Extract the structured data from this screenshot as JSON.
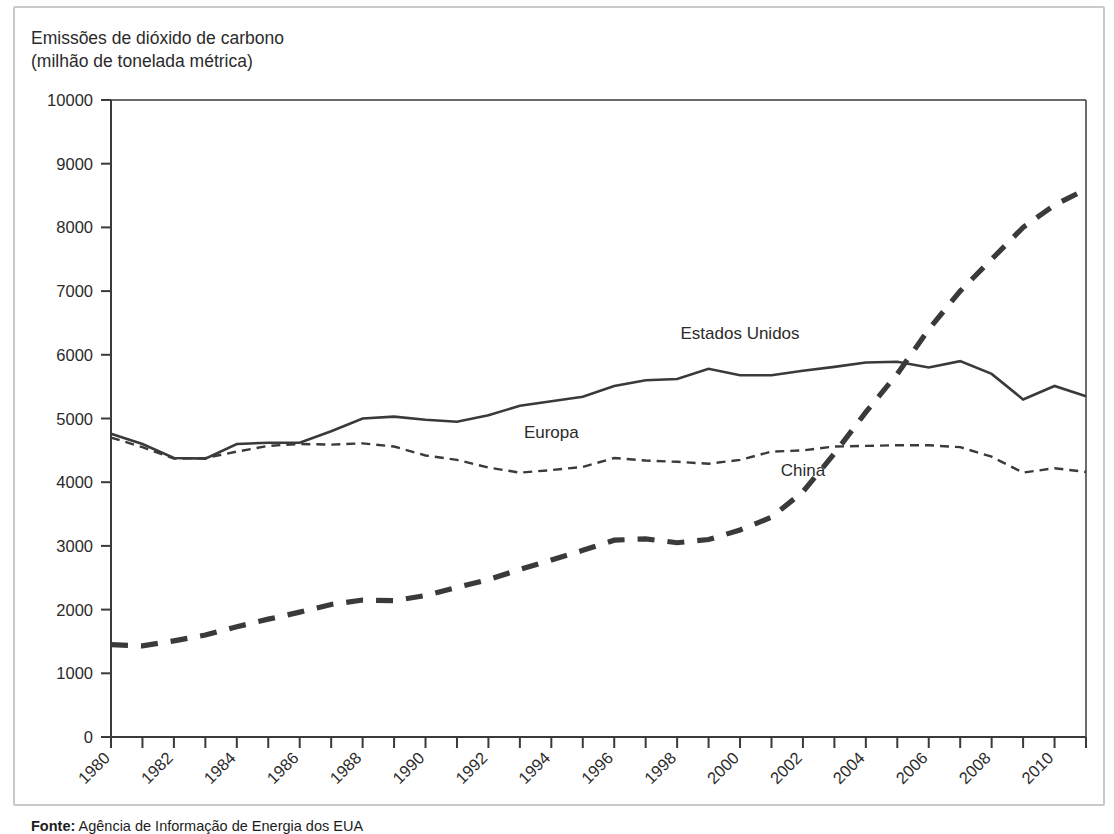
{
  "figure": {
    "axis_title_line1": "Emissões de dióxido de carbono",
    "axis_title_line2": "(milhão de tonelada métrica)",
    "source_label": "Fonte:",
    "source_text": " Agência de Informação de Energia dos EUA",
    "frame_color": "#c9c9c9",
    "line_color": "#3a3a3a",
    "text_color": "#2b2b2b"
  },
  "chart_data": {
    "type": "line",
    "title": "Emissões de dióxido de carbono (milhão de tonelada métrica)",
    "xlabel": "",
    "ylabel": "Emissões de dióxido de carbono (milhão de tonelada métrica)",
    "ylim": [
      0,
      10000
    ],
    "ytick_step": 1000,
    "yticks": [
      0,
      1000,
      2000,
      3000,
      4000,
      5000,
      6000,
      7000,
      8000,
      9000,
      10000
    ],
    "ytick_labels": [
      "0",
      "1000",
      "2000",
      "3000",
      "4000",
      "5000",
      "6000",
      "7000",
      "8000",
      "9000",
      "10000"
    ],
    "xlim": [
      1980,
      2011
    ],
    "x": [
      1980,
      1981,
      1982,
      1983,
      1984,
      1985,
      1986,
      1987,
      1988,
      1989,
      1990,
      1991,
      1992,
      1993,
      1994,
      1995,
      1996,
      1997,
      1998,
      1999,
      2000,
      2001,
      2002,
      2003,
      2004,
      2005,
      2006,
      2007,
      2008,
      2009,
      2010,
      2011
    ],
    "xtick_labels": [
      "1980",
      "",
      "1982",
      "",
      "1984",
      "",
      "1986",
      "",
      "1988",
      "",
      "1990",
      "",
      "1992",
      "",
      "1994",
      "",
      "1996",
      "",
      "1998",
      "",
      "2000",
      "",
      "2002",
      "",
      "2004",
      "",
      "2006",
      "",
      "2008",
      "",
      "2010",
      ""
    ],
    "xtick_labels_shown": [
      "1980",
      "1982",
      "1984",
      "1986",
      "1988",
      "1990",
      "1992",
      "1994",
      "1996",
      "1998",
      "2000",
      "2002",
      "2004",
      "2006",
      "2008",
      "2010"
    ],
    "grid": false,
    "legend_position": "inline-annotations",
    "series": [
      {
        "name": "Estados Unidos",
        "style": "solid",
        "label_x": 2000,
        "label_y": 6250,
        "values": [
          4760,
          4600,
          4380,
          4370,
          4600,
          4620,
          4620,
          4800,
          5000,
          5030,
          4980,
          4950,
          5050,
          5200,
          5270,
          5340,
          5510,
          5600,
          5620,
          5780,
          5680,
          5680,
          5750,
          5810,
          5880,
          5890,
          5800,
          5900,
          5700,
          5300,
          5510,
          5350
        ]
      },
      {
        "name": "Europa",
        "style": "dotted",
        "label_x": 1994,
        "label_y": 4700,
        "values": [
          4700,
          4550,
          4370,
          4380,
          4480,
          4570,
          4600,
          4590,
          4610,
          4560,
          4420,
          4350,
          4230,
          4150,
          4190,
          4240,
          4380,
          4340,
          4320,
          4290,
          4350,
          4480,
          4500,
          4560,
          4570,
          4580,
          4580,
          4550,
          4400,
          4150,
          4220,
          4160
        ]
      },
      {
        "name": "China",
        "style": "dashed-bold",
        "label_x": 2002,
        "label_y": 4100,
        "values": [
          1450,
          1430,
          1510,
          1600,
          1730,
          1850,
          1960,
          2080,
          2150,
          2140,
          2220,
          2350,
          2470,
          2630,
          2780,
          2930,
          3090,
          3110,
          3050,
          3100,
          3250,
          3450,
          3850,
          4450,
          5100,
          5700,
          6400,
          7000,
          7500,
          8000,
          8350,
          8600
        ]
      }
    ]
  }
}
